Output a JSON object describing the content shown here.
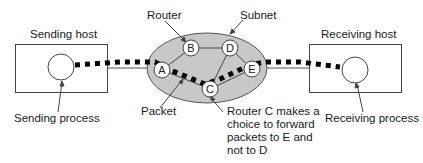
{
  "diagram": {
    "hosts": {
      "sending": {
        "label": "Sending host",
        "process_label": "Sending process"
      },
      "receiving": {
        "label": "Receiving host",
        "process_label": "Receiving process"
      }
    },
    "subnet": {
      "label": "Subnet",
      "router_label": "Router",
      "packet_label": "Packet",
      "nodes": [
        {
          "id": "A",
          "x": 162,
          "y": 70
        },
        {
          "id": "B",
          "x": 191,
          "y": 48
        },
        {
          "id": "C",
          "x": 210,
          "y": 89
        },
        {
          "id": "D",
          "x": 230,
          "y": 48
        },
        {
          "id": "E",
          "x": 252,
          "y": 69
        }
      ],
      "links": [
        [
          "A",
          "B"
        ],
        [
          "B",
          "D"
        ],
        [
          "D",
          "E"
        ],
        [
          "A",
          "C"
        ],
        [
          "C",
          "E"
        ],
        [
          "C",
          "D"
        ]
      ],
      "packet_path": [
        "Sending process",
        "A",
        "C",
        "E",
        "Receiving process"
      ]
    },
    "annotation": "Router C makes a\nchoice to forward\npackets to E and\nnot to D",
    "colors": {
      "subnet_fill": "#c8c8c8",
      "line": "#333333",
      "packet": "#000000",
      "background": "#ffffff"
    }
  }
}
